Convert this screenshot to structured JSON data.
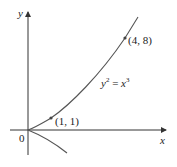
{
  "diagram": {
    "equation": {
      "lhs": "y",
      "lhs_exp": "2",
      "eq": " = ",
      "rhs": "x",
      "rhs_exp": "3"
    },
    "axes": {
      "x_label": "x",
      "y_label": "y",
      "origin_label": "0"
    },
    "points": [
      {
        "label": "(1, 1)",
        "x": 1,
        "y": 1
      },
      {
        "label": "(4, 8)",
        "x": 4,
        "y": 8
      }
    ],
    "colors": {
      "curve": "#555555",
      "axis": "#333333",
      "point": "#444444"
    }
  }
}
